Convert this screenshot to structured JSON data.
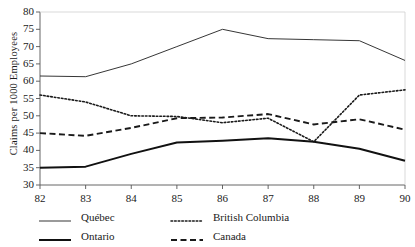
{
  "chart_data": {
    "type": "line",
    "title": "",
    "xlabel": "",
    "ylabel": "Claims per 1000 Employees",
    "x": [
      "82",
      "83",
      "84",
      "85",
      "86",
      "87",
      "88",
      "89",
      "90"
    ],
    "xlim": [
      82,
      90
    ],
    "ylim": [
      30,
      80
    ],
    "yticks": [
      30,
      35,
      40,
      45,
      50,
      55,
      60,
      65,
      70,
      75,
      80
    ],
    "xticks": [
      "82",
      "83",
      "84",
      "85",
      "86",
      "87",
      "88",
      "89",
      "90"
    ],
    "grid": false,
    "legend_position": "bottom",
    "series": [
      {
        "name": "Québec",
        "style": "solid-thin",
        "color": "#2b2b2b",
        "values": [
          61.5,
          61.3,
          65.0,
          70.0,
          75.0,
          72.3,
          72.0,
          71.7,
          66.0
        ]
      },
      {
        "name": "British Columbia",
        "style": "dotted",
        "color": "#1a1a1a",
        "values": [
          56.0,
          54.0,
          50.0,
          49.8,
          48.0,
          49.3,
          42.5,
          56.0,
          57.5
        ]
      },
      {
        "name": "Ontario",
        "style": "solid-thick",
        "color": "#111111",
        "values": [
          35.0,
          35.3,
          39.0,
          42.3,
          42.8,
          43.5,
          42.5,
          40.5,
          37.0
        ]
      },
      {
        "name": "Canada",
        "style": "dashed",
        "color": "#1a1a1a",
        "values": [
          45.0,
          44.2,
          46.5,
          49.3,
          49.5,
          50.5,
          47.5,
          49.0,
          46.0
        ]
      }
    ]
  },
  "legend": {
    "entries": [
      {
        "label": "Québec",
        "series_index": 0
      },
      {
        "label": "British Columbia",
        "series_index": 1
      },
      {
        "label": "Ontario",
        "series_index": 2
      },
      {
        "label": "Canada",
        "series_index": 3
      }
    ]
  }
}
